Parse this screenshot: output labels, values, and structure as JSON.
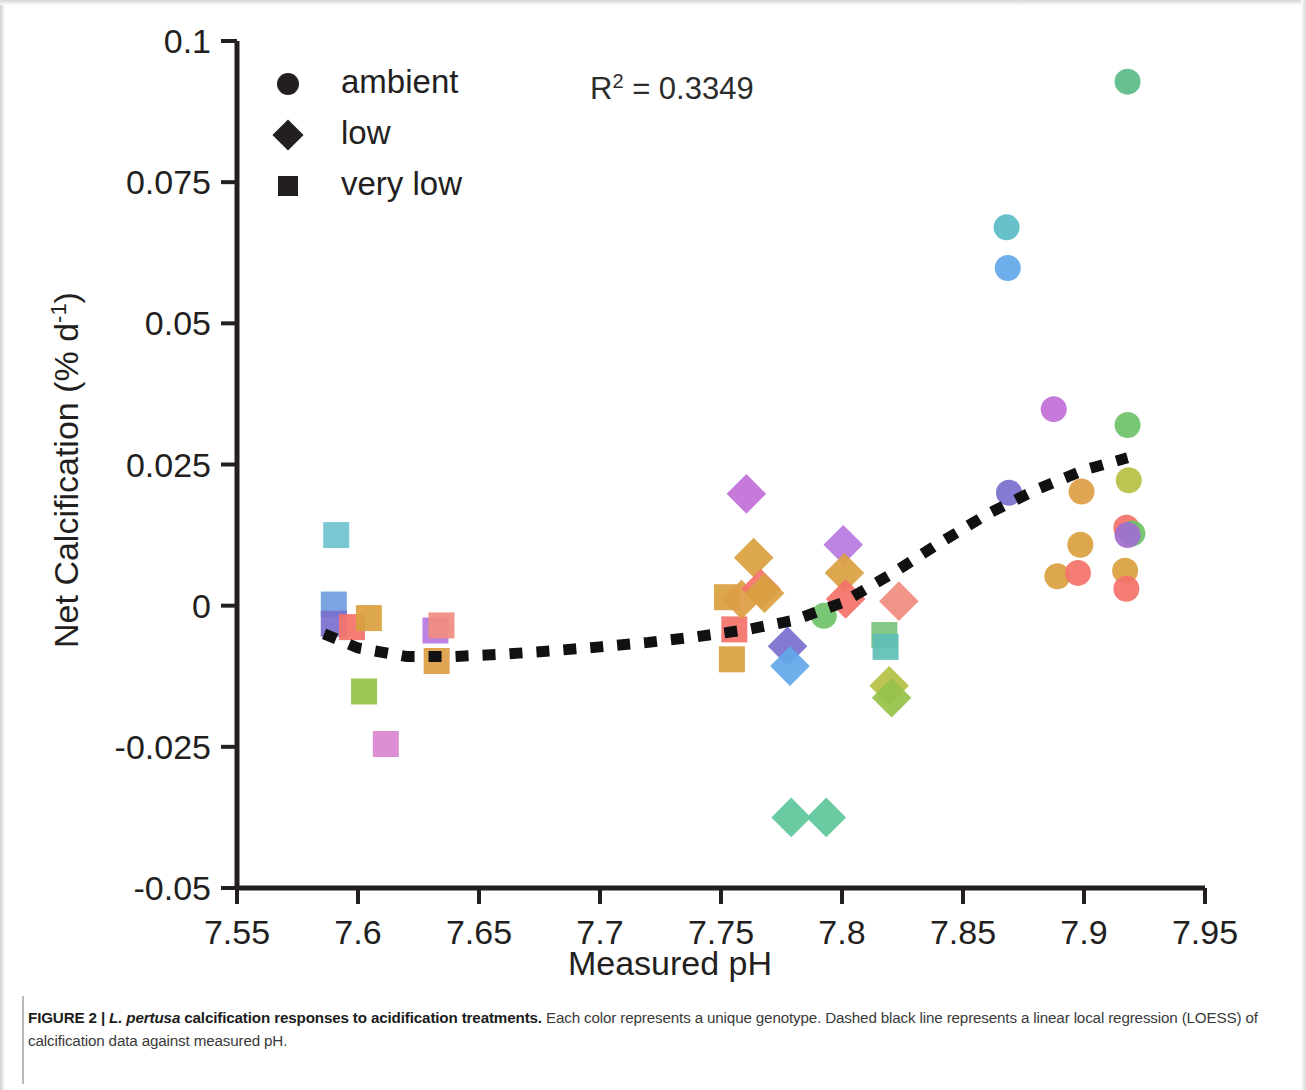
{
  "figure": {
    "caption_label": "FIGURE 2 |",
    "caption_species": "L. pertusa",
    "caption_title_rest": " calcification responses to acidification treatments.",
    "caption_body": " Each color represents a unique genotype. Dashed black line represents a linear local regression (LOESS) of calcification data against measured pH."
  },
  "annotations": {
    "r_squared_label": "R",
    "r_squared_exponent": "2",
    "r_squared_value": " = 0.3349"
  },
  "legend": {
    "items": [
      {
        "label": "ambient",
        "marker": "circle"
      },
      {
        "label": "low",
        "marker": "diamond"
      },
      {
        "label": "very low",
        "marker": "square"
      }
    ],
    "marker_color": "#231f20"
  },
  "chart_data": {
    "type": "scatter",
    "title": "",
    "xlabel": "Measured pH",
    "ylabel": "Net Calcification (% d-1)",
    "ylabel_parts": {
      "main": "Net Calcification (% d",
      "sup": "-1",
      "tail": ")"
    },
    "xlim": [
      7.55,
      7.95
    ],
    "ylim": [
      -0.05,
      0.1
    ],
    "xticks": [
      7.55,
      7.6,
      7.65,
      7.7,
      7.75,
      7.8,
      7.85,
      7.9,
      7.95
    ],
    "xticklabels": [
      "7.55",
      "7.6",
      "7.65",
      "7.7",
      "7.75",
      "7.8",
      "7.85",
      "7.9",
      "7.95"
    ],
    "yticks": [
      -0.05,
      -0.025,
      0,
      0.025,
      0.05,
      0.075,
      0.1
    ],
    "yticklabels": [
      "-0.05",
      "-0.025",
      "0",
      "0.025",
      "0.05",
      "0.075",
      "0.1"
    ],
    "grid": false,
    "legend_position": "top-left",
    "marker_shapes": {
      "ambient": "circle",
      "low": "diamond",
      "very low": "square"
    },
    "r_squared": 0.3349,
    "points": [
      {
        "x": 7.591,
        "y": 0.0125,
        "treatment": "very low",
        "color": "#6fc3cf"
      },
      {
        "x": 7.59,
        "y": 0.0002,
        "treatment": "very low",
        "color": "#6f9fe0"
      },
      {
        "x": 7.59,
        "y": -0.0032,
        "treatment": "very low",
        "color": "#7a70cf"
      },
      {
        "x": 7.5975,
        "y": -0.0038,
        "treatment": "very low",
        "color": "#f4736b"
      },
      {
        "x": 7.6045,
        "y": -0.0022,
        "treatment": "very low",
        "color": "#d9a03f"
      },
      {
        "x": 7.6025,
        "y": -0.0152,
        "treatment": "very low",
        "color": "#96c249"
      },
      {
        "x": 7.6115,
        "y": -0.0245,
        "treatment": "very low",
        "color": "#d987cf"
      },
      {
        "x": 7.632,
        "y": -0.0044,
        "treatment": "very low",
        "color": "#b878e0"
      },
      {
        "x": 7.6325,
        "y": -0.0098,
        "treatment": "very low",
        "color": "#dd9e46"
      },
      {
        "x": 7.6345,
        "y": -0.0035,
        "treatment": "very low",
        "color": "#f08d7f"
      },
      {
        "x": 7.7525,
        "y": 0.0015,
        "treatment": "very low",
        "color": "#d9a03f"
      },
      {
        "x": 7.7555,
        "y": -0.0042,
        "treatment": "very low",
        "color": "#f4736b"
      },
      {
        "x": 7.7545,
        "y": -0.0095,
        "treatment": "very low",
        "color": "#d9a03f"
      },
      {
        "x": 7.7585,
        "y": 0.0011,
        "treatment": "low",
        "color": "#dd9e46"
      },
      {
        "x": 7.7605,
        "y": 0.0198,
        "treatment": "low",
        "color": "#c270d6"
      },
      {
        "x": 7.7635,
        "y": 0.0085,
        "treatment": "low",
        "color": "#d9a03f"
      },
      {
        "x": 7.7665,
        "y": 0.003,
        "treatment": "low",
        "color": "#f4736b"
      },
      {
        "x": 7.768,
        "y": 0.0022,
        "treatment": "low",
        "color": "#d9a03f"
      },
      {
        "x": 7.7775,
        "y": -0.0072,
        "treatment": "low",
        "color": "#7a70cf"
      },
      {
        "x": 7.7785,
        "y": -0.0107,
        "treatment": "low",
        "color": "#63a8e8"
      },
      {
        "x": 7.779,
        "y": -0.0375,
        "treatment": "low",
        "color": "#5fc79b"
      },
      {
        "x": 7.7925,
        "y": -0.0018,
        "treatment": "ambient",
        "color": "#6fc26b"
      },
      {
        "x": 7.7935,
        "y": -0.0375,
        "treatment": "low",
        "color": "#5fc79b"
      },
      {
        "x": 7.8005,
        "y": 0.0108,
        "treatment": "low",
        "color": "#b878e0"
      },
      {
        "x": 7.801,
        "y": 0.0058,
        "treatment": "low",
        "color": "#d9a03f"
      },
      {
        "x": 7.8015,
        "y": 0.0012,
        "treatment": "low",
        "color": "#f4736b"
      },
      {
        "x": 7.8175,
        "y": -0.0052,
        "treatment": "very low",
        "color": "#7bc47f"
      },
      {
        "x": 7.818,
        "y": -0.0073,
        "treatment": "very low",
        "color": "#5fc0b5"
      },
      {
        "x": 7.8195,
        "y": -0.0142,
        "treatment": "low",
        "color": "#b6c144"
      },
      {
        "x": 7.8205,
        "y": -0.0163,
        "treatment": "low",
        "color": "#96c249"
      },
      {
        "x": 7.8235,
        "y": 0.0008,
        "treatment": "low",
        "color": "#f08d7f"
      },
      {
        "x": 7.868,
        "y": 0.067,
        "treatment": "ambient",
        "color": "#5bbcc6"
      },
      {
        "x": 7.8685,
        "y": 0.0598,
        "treatment": "ambient",
        "color": "#63a8e8"
      },
      {
        "x": 7.869,
        "y": 0.02,
        "treatment": "ambient",
        "color": "#7a70cf"
      },
      {
        "x": 7.8875,
        "y": 0.0348,
        "treatment": "ambient",
        "color": "#c270d6"
      },
      {
        "x": 7.889,
        "y": 0.0052,
        "treatment": "ambient",
        "color": "#d9a03f"
      },
      {
        "x": 7.899,
        "y": 0.0202,
        "treatment": "ambient",
        "color": "#dd9e46"
      },
      {
        "x": 7.8985,
        "y": 0.0108,
        "treatment": "ambient",
        "color": "#d9a03f"
      },
      {
        "x": 7.8975,
        "y": 0.0058,
        "treatment": "ambient",
        "color": "#f4736b"
      },
      {
        "x": 7.918,
        "y": 0.0928,
        "treatment": "ambient",
        "color": "#5dba86"
      },
      {
        "x": 7.918,
        "y": 0.032,
        "treatment": "ambient",
        "color": "#6fc26b"
      },
      {
        "x": 7.9185,
        "y": 0.0222,
        "treatment": "ambient",
        "color": "#b6c144"
      },
      {
        "x": 7.9175,
        "y": 0.0138,
        "treatment": "ambient",
        "color": "#f4736b"
      },
      {
        "x": 7.92,
        "y": 0.0128,
        "treatment": "ambient",
        "color": "#6fc26b"
      },
      {
        "x": 7.918,
        "y": 0.0125,
        "treatment": "ambient",
        "color": "#a06fd0"
      },
      {
        "x": 7.917,
        "y": 0.0062,
        "treatment": "ambient",
        "color": "#d9a03f"
      },
      {
        "x": 7.9175,
        "y": 0.003,
        "treatment": "ambient",
        "color": "#f4736b"
      }
    ],
    "loess": {
      "name": "LOESS fit",
      "style": "dashed",
      "color": "#111111",
      "x": [
        7.586,
        7.6,
        7.62,
        7.64,
        7.66,
        7.68,
        7.7,
        7.72,
        7.74,
        7.76,
        7.78,
        7.8,
        7.82,
        7.84,
        7.86,
        7.88,
        7.9,
        7.918
      ],
      "y": [
        -0.005,
        -0.0075,
        -0.009,
        -0.009,
        -0.0086,
        -0.008,
        -0.0073,
        -0.0065,
        -0.0055,
        -0.0043,
        -0.0026,
        0.0005,
        0.0055,
        0.011,
        0.0162,
        0.0205,
        0.024,
        0.0262
      ]
    }
  }
}
